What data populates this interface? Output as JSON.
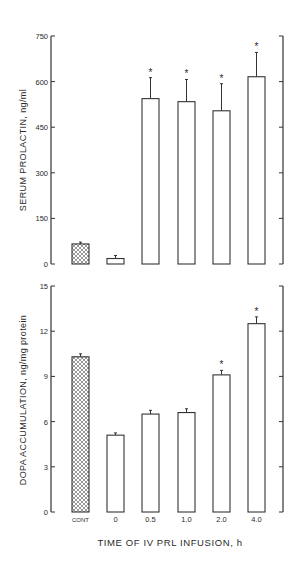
{
  "figure": {
    "xlabel": "TIME OF IV PRL INFUSION, h",
    "categories": [
      "CONT",
      "0",
      "0.5",
      "1.0",
      "2.0",
      "4.0"
    ]
  },
  "chart_data": [
    {
      "type": "bar",
      "title": "",
      "xlabel": "TIME OF IV PRL INFUSION, h",
      "ylabel": "SERUM PROLACTIN, ng/ml",
      "ylim": [
        0,
        750
      ],
      "yticks": [
        0,
        150,
        300,
        450,
        600,
        750
      ],
      "categories": [
        "CONT",
        "0",
        "0.5",
        "1.0",
        "2.0",
        "4.0"
      ],
      "values": [
        66,
        18,
        544,
        534,
        504,
        616
      ],
      "error": [
        6,
        10,
        69,
        73,
        89,
        80
      ],
      "significant": [
        false,
        false,
        true,
        true,
        true,
        true
      ],
      "bar_styles": [
        "hatched",
        "open",
        "open",
        "open",
        "open",
        "open"
      ],
      "grid": false,
      "legend": null
    },
    {
      "type": "bar",
      "title": "",
      "xlabel": "TIME OF IV PRL INFUSION, h",
      "ylabel": "DOPA ACCUMULATION, ng/mg protein",
      "ylim": [
        0,
        15
      ],
      "yticks": [
        0,
        3,
        6,
        9,
        12,
        15
      ],
      "categories": [
        "CONT",
        "0",
        "0.5",
        "1.0",
        "2.0",
        "4.0"
      ],
      "values": [
        10.3,
        5.1,
        6.5,
        6.6,
        9.1,
        12.5
      ],
      "error": [
        0.2,
        0.15,
        0.25,
        0.25,
        0.3,
        0.45
      ],
      "significant": [
        false,
        false,
        false,
        false,
        true,
        true
      ],
      "bar_styles": [
        "hatched",
        "open",
        "open",
        "open",
        "open",
        "open"
      ],
      "grid": false,
      "legend": null
    }
  ]
}
